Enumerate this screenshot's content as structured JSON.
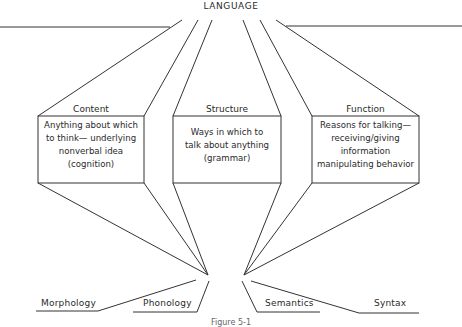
{
  "diagram": {
    "root": {
      "label": "LANGUAGE"
    },
    "components": [
      {
        "heading": "Content",
        "lines": [
          "Anything about which",
          "to think— underlying",
          "nonverbal idea",
          "(cognition)"
        ]
      },
      {
        "heading": "Structure",
        "lines": [
          "Ways in which to",
          "talk about anything",
          "(grammar)"
        ]
      },
      {
        "heading": "Function",
        "lines": [
          "Reasons for talking—",
          "receiving/giving",
          "information",
          "manipulating behavior"
        ]
      }
    ],
    "subcomponents": [
      {
        "label": "Morphology"
      },
      {
        "label": "Phonology"
      },
      {
        "label": "Semantics"
      },
      {
        "label": "Syntax"
      }
    ],
    "caption": "Figure 5-1"
  }
}
